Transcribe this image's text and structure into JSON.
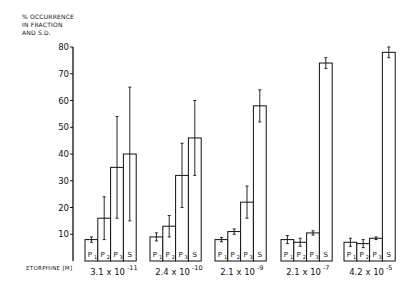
{
  "chart_data": {
    "type": "bar",
    "title": "",
    "ylabel_lines": [
      "% OCCURRENCE",
      "IN FRACTION",
      "AND S.D."
    ],
    "xlabel": "ETORPHINE [M]",
    "ylim": [
      0,
      80
    ],
    "yticks": [
      10,
      20,
      30,
      40,
      50,
      60,
      70,
      80
    ],
    "grid": false,
    "legend": "none",
    "categories": [
      "3.1 x 10^-11",
      "2.4 x 10^-10",
      "2.1 x 10^-9",
      "2.1 x 10^-7",
      "4.2 x 10^-5"
    ],
    "category_labels": [
      {
        "base": "3.1 x 10",
        "exp": "-11"
      },
      {
        "base": "2.4 x 10",
        "exp": "-10"
      },
      {
        "base": "2.1 x 10",
        "exp": "-9"
      },
      {
        "base": "2.1 x 10",
        "exp": "-7"
      },
      {
        "base": "4.2 x 10",
        "exp": "-5"
      }
    ],
    "series": [
      {
        "name": "P1",
        "label": "P",
        "sub": "1",
        "values": [
          8,
          9,
          8,
          8,
          7
        ],
        "sd": [
          1,
          1.5,
          0.8,
          1.5,
          1.5
        ]
      },
      {
        "name": "P2",
        "label": "P",
        "sub": "2",
        "values": [
          16,
          13,
          11,
          7,
          6.5
        ],
        "sd": [
          8,
          4,
          1,
          1.5,
          1.5
        ]
      },
      {
        "name": "P3",
        "label": "P",
        "sub": "3",
        "values": [
          35,
          32,
          22,
          10.5,
          8.5
        ],
        "sd": [
          19,
          12,
          6,
          0.8,
          0.5
        ]
      },
      {
        "name": "S",
        "label": "S",
        "sub": "",
        "values": [
          40,
          46,
          58,
          74,
          78
        ],
        "sd": [
          25,
          14,
          6,
          2,
          2
        ]
      }
    ]
  }
}
